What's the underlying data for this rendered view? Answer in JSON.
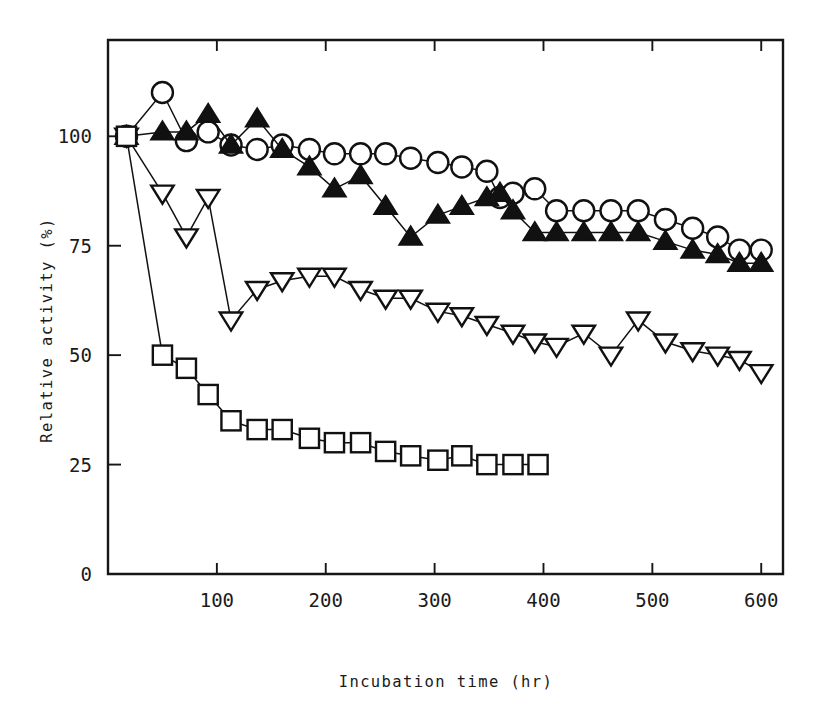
{
  "figure": {
    "background_color": "#ffffff",
    "ink_color": "#111111"
  },
  "chart_data": {
    "type": "line",
    "title": "",
    "subtitle": "",
    "xlabel": "Incubation time  (hr)",
    "ylabel": "Relative activity (%)",
    "xlim": [
      0,
      620
    ],
    "ylim": [
      0,
      122
    ],
    "xticks": [
      100,
      200,
      300,
      400,
      500,
      600
    ],
    "xticklabels": [
      "100",
      "200",
      "300",
      "400",
      "500",
      "600"
    ],
    "yticks": [
      0,
      25,
      50,
      75,
      100
    ],
    "yticklabels": [
      "0",
      "25",
      "50",
      "75",
      "100"
    ],
    "grid": false,
    "legend": "none",
    "frame": "box",
    "series": [
      {
        "name": "open-circle",
        "marker": "circle-open",
        "x": [
          17,
          50,
          72,
          92,
          113,
          137,
          160,
          185,
          208,
          232,
          255,
          278,
          303,
          325,
          348,
          360,
          372,
          392,
          412,
          437,
          462,
          487,
          512,
          537,
          560,
          580,
          600
        ],
        "y": [
          100,
          110,
          99,
          101,
          98,
          97,
          98,
          97,
          96,
          96,
          96,
          95,
          94,
          93,
          92,
          86,
          87,
          88,
          83,
          83,
          83,
          83,
          81,
          79,
          77,
          74,
          74
        ]
      },
      {
        "name": "filled-triangle-up",
        "marker": "triangle-up-filled",
        "x": [
          17,
          50,
          72,
          92,
          113,
          137,
          160,
          185,
          208,
          232,
          255,
          278,
          303,
          325,
          348,
          360,
          372,
          392,
          412,
          437,
          462,
          487,
          512,
          537,
          560,
          580,
          600
        ],
        "y": [
          100,
          101,
          101,
          105,
          98,
          104,
          97,
          93,
          88,
          91,
          84,
          77,
          82,
          84,
          86,
          87,
          83,
          78,
          78,
          78,
          78,
          78,
          76,
          74,
          73,
          71,
          71
        ]
      },
      {
        "name": "open-triangle-down",
        "marker": "triangle-down-open",
        "x": [
          17,
          50,
          72,
          92,
          113,
          137,
          160,
          185,
          208,
          232,
          255,
          278,
          303,
          325,
          348,
          372,
          392,
          412,
          437,
          462,
          487,
          512,
          537,
          560,
          580,
          600
        ],
        "y": [
          100,
          87,
          77,
          86,
          58,
          65,
          67,
          68,
          68,
          65,
          63,
          63,
          60,
          59,
          57,
          55,
          53,
          52,
          55,
          50,
          58,
          53,
          51,
          50,
          49,
          46
        ]
      },
      {
        "name": "open-square",
        "marker": "square-open",
        "x": [
          17,
          50,
          72,
          92,
          113,
          137,
          160,
          185,
          208,
          232,
          255,
          278,
          303,
          325,
          348,
          372,
          395
        ],
        "y": [
          100,
          50,
          47,
          41,
          35,
          33,
          33,
          31,
          30,
          30,
          28,
          27,
          26,
          27,
          25,
          25,
          25
        ]
      }
    ]
  }
}
